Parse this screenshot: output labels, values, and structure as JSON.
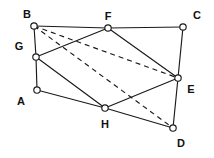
{
  "figure": {
    "type": "geometric-graph-diagram",
    "background_color": "#ffffff",
    "stroke_color": "#1a1a1a",
    "width": 214,
    "height": 158
  },
  "vertices": [
    {
      "id": "A",
      "label": "A",
      "x": 37,
      "y": 90,
      "label_x": 21,
      "label_y": 101,
      "radius": 3.2
    },
    {
      "id": "B",
      "label": "B",
      "x": 34,
      "y": 26,
      "label_x": 27,
      "label_y": 14,
      "radius": 3.2
    },
    {
      "id": "C",
      "label": "C",
      "x": 183,
      "y": 27,
      "label_x": 197,
      "label_y": 15,
      "radius": 3.2
    },
    {
      "id": "D",
      "label": "D",
      "x": 173,
      "y": 128,
      "label_x": 181,
      "label_y": 143,
      "radius": 3.2
    },
    {
      "id": "E",
      "label": "E",
      "x": 178,
      "y": 78,
      "label_x": 191,
      "label_y": 89,
      "radius": 3.2
    },
    {
      "id": "F",
      "label": "F",
      "x": 108,
      "y": 28,
      "label_x": 108,
      "label_y": 16,
      "radius": 3.2
    },
    {
      "id": "G",
      "label": "G",
      "x": 36,
      "y": 57,
      "label_x": 19,
      "label_y": 46,
      "radius": 3.2
    },
    {
      "id": "H",
      "label": "H",
      "x": 105,
      "y": 108,
      "label_x": 105,
      "label_y": 124,
      "radius": 3.2
    }
  ],
  "edges": [
    {
      "from": "B",
      "to": "F",
      "style": "solid"
    },
    {
      "from": "F",
      "to": "C",
      "style": "solid"
    },
    {
      "from": "B",
      "to": "G",
      "style": "solid"
    },
    {
      "from": "G",
      "to": "A",
      "style": "solid"
    },
    {
      "from": "C",
      "to": "E",
      "style": "solid"
    },
    {
      "from": "E",
      "to": "D",
      "style": "solid"
    },
    {
      "from": "G",
      "to": "F",
      "style": "solid"
    },
    {
      "from": "F",
      "to": "E",
      "style": "solid"
    },
    {
      "from": "G",
      "to": "H",
      "style": "solid"
    },
    {
      "from": "H",
      "to": "E",
      "style": "solid"
    },
    {
      "from": "A",
      "to": "H",
      "style": "solid"
    },
    {
      "from": "H",
      "to": "D",
      "style": "solid"
    },
    {
      "from": "B",
      "to": "D",
      "style": "dashed"
    },
    {
      "from": "B",
      "to": "E",
      "style": "dashed"
    }
  ]
}
